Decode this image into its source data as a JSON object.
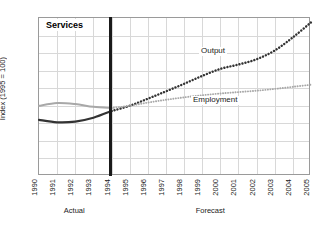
{
  "chart_data": {
    "type": "line",
    "title": "Services",
    "xlabel": "",
    "ylabel": "Index (1995 = 100)",
    "ylim": [
      60,
      150
    ],
    "ytick_values": [
      150,
      140,
      130,
      120,
      110,
      100,
      90,
      80,
      70,
      60
    ],
    "x": [
      1990,
      1991,
      1992,
      1993,
      1994,
      1995,
      1996,
      1997,
      1998,
      1999,
      2000,
      2001,
      2002,
      2003,
      2004,
      2005
    ],
    "xtick_labels": [
      "1990",
      "1991",
      "1992",
      "1993",
      "1994",
      "1995",
      "1996",
      "1997",
      "1998",
      "1999",
      "2000",
      "2001",
      "2002",
      "2003",
      "2004",
      "2005"
    ],
    "grid": true,
    "legend_position": "inline-annotations",
    "series": [
      {
        "name": "Output",
        "style": "solid-then-dotted",
        "color": "#333333",
        "values": [
          92.0,
          90.6,
          91.0,
          93.2,
          97.0,
          100.0,
          104.0,
          108.2,
          112.5,
          117.0,
          121.0,
          123.5,
          126.5,
          131.5,
          139.0,
          147.5
        ]
      },
      {
        "name": "Employment",
        "style": "solid-then-dotted",
        "color": "#a8a8a8",
        "values": [
          100.0,
          101.6,
          101.0,
          99.4,
          98.7,
          100.0,
          101.8,
          103.4,
          104.8,
          106.0,
          107.0,
          107.8,
          108.6,
          109.6,
          110.8,
          112.0
        ]
      }
    ],
    "annotations": [
      {
        "text": "Output",
        "near_series": "Output"
      },
      {
        "text": "Employment",
        "near_series": "Employment"
      }
    ],
    "divider": {
      "at_x": 1994,
      "style": "thick-vertical-rule"
    },
    "phase_labels": [
      {
        "text": "Actual",
        "span": [
          1990,
          1994
        ]
      },
      {
        "text": "Forecast",
        "span": [
          1994,
          2005
        ]
      }
    ]
  },
  "colors": {
    "output": "#333333",
    "employment": "#a8a8a8",
    "grid": "#d8d8d8",
    "frame": "#9a9a9a",
    "text": "#1a1a1a",
    "background": "#ffffff"
  }
}
